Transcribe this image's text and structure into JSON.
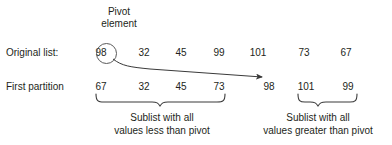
{
  "diagram": {
    "annotations": {
      "pivot_label_line1": "Pivot",
      "pivot_label_line2": "element"
    },
    "rows": [
      {
        "name": "original-list",
        "label": "Original list:",
        "values": [
          "98",
          "32",
          "45",
          "99",
          "101",
          "73",
          "67"
        ],
        "circled_index": 0
      },
      {
        "name": "first-partition",
        "label": "First partition",
        "values": [
          "67",
          "32",
          "45",
          "73",
          "98",
          "101",
          "99"
        ],
        "pivot_index": 4
      }
    ],
    "captions": {
      "less": {
        "line1": "Sublist with all",
        "line2": "values less than pivot"
      },
      "greater": {
        "line1": "Sublist with all",
        "line2": "values greater than pivot"
      }
    },
    "colors": {
      "ink": "#231f20",
      "stroke": "#4a4a4a",
      "background": "#ffffff"
    }
  }
}
